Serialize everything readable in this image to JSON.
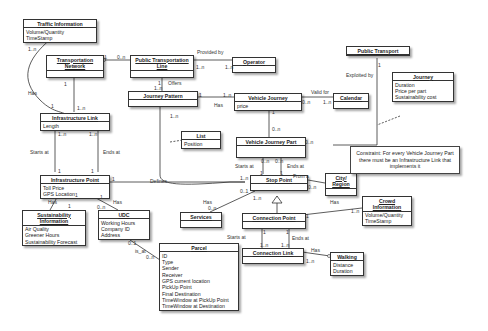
{
  "diagram": {
    "type": "UML class diagram",
    "classes": [
      {
        "id": "traffic_info",
        "name": "Traffic Information",
        "attrs": [
          "Volume/Quantity",
          "TimeStamp"
        ]
      },
      {
        "id": "transport_network",
        "name": "Transportation Network",
        "attrs": []
      },
      {
        "id": "pt_line",
        "name": "Public Transportation Line",
        "attrs": []
      },
      {
        "id": "operator",
        "name": "Operator",
        "attrs": []
      },
      {
        "id": "public_transport",
        "name": "Public Transport",
        "attrs": []
      },
      {
        "id": "journey",
        "name": "Journey",
        "attrs": [
          "Duration",
          "Price per part",
          "Sustainability cost"
        ]
      },
      {
        "id": "journey_pattern",
        "name": "Journey Pattern",
        "attrs": []
      },
      {
        "id": "vehicle_journey",
        "name": "Vehicle Journey",
        "attrs": [
          "price"
        ]
      },
      {
        "id": "calendar",
        "name": "Calendar",
        "attrs": []
      },
      {
        "id": "infra_link",
        "name": "Infrastructure Link",
        "attrs": [
          "Length"
        ]
      },
      {
        "id": "list",
        "name": "List",
        "attrs": [
          "Position"
        ]
      },
      {
        "id": "vj_part",
        "name": "Vehicle Journey Part",
        "attrs": []
      },
      {
        "id": "infra_point",
        "name": "Infrastructure Point",
        "attrs": [
          "Toll Price",
          "GPS Location"
        ]
      },
      {
        "id": "stop_point",
        "name": "Stop Point",
        "attrs": []
      },
      {
        "id": "city_region",
        "name": "City/ Region",
        "attrs": []
      },
      {
        "id": "sustain_info",
        "name": "Sustainability Information",
        "attrs": [
          "Air Quality",
          "Greener Hours",
          "Sustainability Forecast"
        ]
      },
      {
        "id": "udc",
        "name": "UDC",
        "attrs": [
          "Working Hours",
          "Company ID",
          "Address"
        ]
      },
      {
        "id": "services",
        "name": "Services",
        "attrs": []
      },
      {
        "id": "connection_point",
        "name": "Connection Point",
        "attrs": []
      },
      {
        "id": "crowd_info",
        "name": "Crowd Information",
        "attrs": [
          "Volume/Quantity",
          "TimeStamp"
        ]
      },
      {
        "id": "connection_link",
        "name": "Connection Link",
        "attrs": []
      },
      {
        "id": "walking",
        "name": "Walking",
        "attrs": [
          "Distance",
          "Duration"
        ]
      },
      {
        "id": "parcel",
        "name": "Parcel",
        "attrs": [
          "ID",
          "Type",
          "Sender",
          "Receiver",
          "GPS current location",
          "PickUp Point",
          "Final Destination",
          "TimeWindow at PickUp Point",
          "TimeWindow at Destination"
        ]
      }
    ],
    "note": "Constraint: For every Vehicle Journey Part there must be an Infrastructure Link that implements it",
    "labels": {
      "provided_by": "Provided by",
      "offers": "Offers",
      "has": "Has",
      "valid_for": "Valid for",
      "exploited_by": "Exploited by",
      "starts_at": "Starts at",
      "ends_at": "Ends at",
      "defines": "Defines",
      "from_a": "From a",
      "is_at": "is_at",
      "one": "1",
      "one_n": "1..n",
      "zero_n": "0..n",
      "zero_one": "0..1"
    }
  }
}
